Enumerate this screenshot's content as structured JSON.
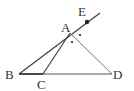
{
  "diagram": {
    "type": "geometry",
    "points": {
      "A": {
        "label": "A",
        "x": 70,
        "y": 33,
        "label_x": 61,
        "label_y": 32
      },
      "B": {
        "label": "B",
        "x": 19,
        "y": 74,
        "label_x": 6,
        "label_y": 79
      },
      "C": {
        "label": "C",
        "x": 43,
        "y": 74,
        "label_x": 37,
        "label_y": 89
      },
      "D": {
        "label": "D",
        "x": 112,
        "y": 74,
        "label_x": 113,
        "label_y": 79
      },
      "E": {
        "label": "E",
        "x": 87,
        "y": 22,
        "label_x": 79,
        "label_y": 16
      }
    },
    "segments": [
      "AB",
      "AC",
      "AD",
      "BD",
      "AE (ray extension of BA)"
    ],
    "angle_marks": [
      {
        "angle": "EAD",
        "mark": "dot"
      },
      {
        "angle": "CAD",
        "mark": "dot"
      }
    ],
    "colors": {
      "line": "#444444",
      "text": "#333333"
    }
  }
}
